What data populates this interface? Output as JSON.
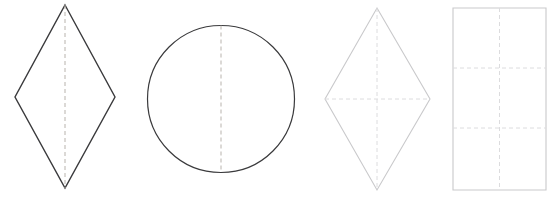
{
  "canvas": {
    "width": 560,
    "height": 201,
    "background_color": "#ffffff"
  },
  "palette": {
    "dark_stroke": "#3a3a3c",
    "light_stroke": "#c9c9cb",
    "dashed_dark": "#b8b3ad",
    "dashed_light": "#dcdcde"
  },
  "figure": {
    "shape_count": 4
  },
  "shapes": [
    {
      "index": 1,
      "name": "rhombus-dark",
      "label": "Rhombus",
      "type": "polygon",
      "stroke_color": "#3a3a3c",
      "stroke_width": 1.4,
      "fill": "none",
      "points": "65,5 115,97 65,188 15,97",
      "vertices": [
        {
          "x": 65,
          "y": 5
        },
        {
          "x": 115,
          "y": 97
        },
        {
          "x": 65,
          "y": 188
        },
        {
          "x": 15,
          "y": 97
        }
      ],
      "symmetry_lines": [
        {
          "name": "vertical-symmetry-line",
          "orientation": "vertical",
          "x1": 65,
          "y1": 5,
          "x2": 65,
          "y2": 188,
          "color": "#b8b3ad",
          "dash": "4 3",
          "stroke_width": 1
        }
      ],
      "symmetry_line_count": 1
    },
    {
      "index": 2,
      "name": "circle-dark",
      "label": "Circle",
      "type": "circle",
      "stroke_color": "#3a3a3c",
      "stroke_width": 1.2,
      "fill": "none",
      "cx": 221,
      "cy": 99,
      "r": 73.5,
      "symmetry_lines": [
        {
          "name": "vertical-symmetry-line",
          "orientation": "vertical",
          "x1": 221,
          "y1": 25.5,
          "x2": 221,
          "y2": 172.5,
          "color": "#b8b3ad",
          "dash": "4 3",
          "stroke_width": 1
        }
      ],
      "symmetry_line_count": 1
    },
    {
      "index": 3,
      "name": "rhombus-light",
      "label": "Rhombus",
      "type": "polygon",
      "stroke_color": "#c9c9cb",
      "stroke_width": 1.1,
      "fill": "none",
      "points": "377,8 430,99 377,190 325,99",
      "vertices": [
        {
          "x": 377,
          "y": 8
        },
        {
          "x": 430,
          "y": 99
        },
        {
          "x": 377,
          "y": 190
        },
        {
          "x": 325,
          "y": 99
        }
      ],
      "symmetry_lines": [
        {
          "name": "vertical-symmetry-line",
          "orientation": "vertical",
          "x1": 377,
          "y1": 8,
          "x2": 377,
          "y2": 190,
          "color": "#dcdcde",
          "dash": "4 3",
          "stroke_width": 1
        },
        {
          "name": "horizontal-symmetry-line",
          "orientation": "horizontal",
          "x1": 325,
          "y1": 99,
          "x2": 430,
          "y2": 99,
          "color": "#dcdcde",
          "dash": "4 3",
          "stroke_width": 1
        }
      ],
      "symmetry_line_count": 2
    },
    {
      "index": 4,
      "name": "rectangle-light",
      "label": "Rectangle",
      "type": "rect",
      "stroke_color": "#c9c9cb",
      "stroke_width": 1.1,
      "fill": "none",
      "x": 453,
      "y": 8,
      "width": 93,
      "height": 182,
      "symmetry_lines": [
        {
          "name": "vertical-symmetry-line",
          "orientation": "vertical",
          "x1": 499.5,
          "y1": 8,
          "x2": 499.5,
          "y2": 190,
          "color": "#dcdcde",
          "dash": "4 3",
          "stroke_width": 1
        },
        {
          "name": "horizontal-grid-line-upper",
          "orientation": "horizontal",
          "x1": 453,
          "y1": 68,
          "x2": 546,
          "y2": 68,
          "color": "#dcdcde",
          "dash": "4 3",
          "stroke_width": 1
        },
        {
          "name": "horizontal-grid-line-lower",
          "orientation": "horizontal",
          "x1": 453,
          "y1": 128,
          "x2": 546,
          "y2": 128,
          "color": "#dcdcde",
          "dash": "4 3",
          "stroke_width": 1
        }
      ],
      "symmetry_line_count": 3
    }
  ]
}
